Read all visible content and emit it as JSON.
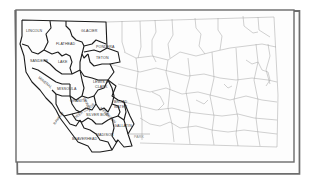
{
  "map": {
    "title": "",
    "region": "Montana",
    "border_color": "#555555",
    "highlight_outline_color": "#1a1a1a",
    "county_line_color": "#8a8a8a",
    "background": "#ffffff",
    "highlighted_counties": [
      {
        "id": "lincoln",
        "label": "LINCOLN"
      },
      {
        "id": "flathead",
        "label": "FLATHEAD"
      },
      {
        "id": "glacier",
        "label": "GLACIER"
      },
      {
        "id": "pondera",
        "label": "PONDERA"
      },
      {
        "id": "teton",
        "label": "TETON"
      },
      {
        "id": "sanders",
        "label": "SANDERS"
      },
      {
        "id": "lake",
        "label": "LAKE"
      },
      {
        "id": "mineral",
        "label": "MINERAL"
      },
      {
        "id": "missoula",
        "label": "MISSOULA"
      },
      {
        "id": "lewis_clark",
        "label": "LEWIS &",
        "label2": "CLARK"
      },
      {
        "id": "powell",
        "label": "POWELL"
      },
      {
        "id": "ravalli",
        "label": "RAVALLI"
      },
      {
        "id": "granite",
        "label": "GRANITE"
      },
      {
        "id": "deer_lodge",
        "label": "DEER LODGE"
      },
      {
        "id": "silver_bow",
        "label": "SILVER BOW"
      },
      {
        "id": "jefferson",
        "label": "JEFFERSON"
      },
      {
        "id": "broadwater",
        "label": "BROAD",
        "label2": "WATER"
      },
      {
        "id": "beaverhead",
        "label": "BEAVERHEAD"
      },
      {
        "id": "madison",
        "label": "MADISON"
      },
      {
        "id": "gallatin",
        "label": "GALLATIN"
      },
      {
        "id": "park",
        "label": "PARK"
      }
    ]
  }
}
